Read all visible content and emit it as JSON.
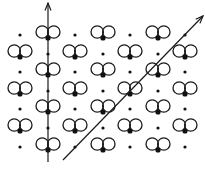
{
  "diagram": {
    "colors": {
      "background": "#ffffff",
      "ink": "#1a1a1a"
    },
    "grid": {
      "columns_x": [
        20,
        48,
        75,
        103,
        130,
        158,
        185
      ],
      "rows_y": [
        38,
        57,
        75,
        94,
        112,
        131,
        150
      ],
      "lobe_radius": 6.2,
      "lobe_offset_x": 5.8,
      "lobe_offset_y": -6,
      "atom_radius": 2.6,
      "site_radius": 1.6
    },
    "rows": [
      {
        "y": 38,
        "molecules_x": [
          48,
          103,
          158
        ],
        "dots_x": [
          20,
          75,
          130,
          185
        ]
      },
      {
        "y": 57,
        "molecules_x": [
          20,
          75,
          130,
          185
        ],
        "dots_x": [
          48,
          103,
          158
        ]
      },
      {
        "y": 75,
        "molecules_x": [
          48,
          103,
          158
        ],
        "dots_x": [
          20,
          75,
          130,
          185
        ]
      },
      {
        "y": 94,
        "molecules_x": [
          20,
          75,
          130,
          185
        ],
        "dots_x": [
          48,
          103,
          158
        ]
      },
      {
        "y": 112,
        "molecules_x": [
          48,
          103,
          158
        ],
        "dots_x": [
          20,
          75,
          130,
          185
        ]
      },
      {
        "y": 131,
        "molecules_x": [
          20,
          75,
          130,
          185
        ],
        "dots_x": [
          48,
          103,
          158
        ]
      },
      {
        "y": 150,
        "molecules_x": [
          48,
          103,
          158
        ],
        "dots_x": [
          20,
          75,
          130,
          185
        ]
      }
    ],
    "arrows": [
      {
        "name": "vertical-arrow",
        "from": [
          48,
          162
        ],
        "to": [
          48,
          3
        ]
      },
      {
        "name": "diagonal-arrow",
        "from": [
          63,
          160
        ],
        "to": [
          203,
          16
        ]
      }
    ]
  }
}
